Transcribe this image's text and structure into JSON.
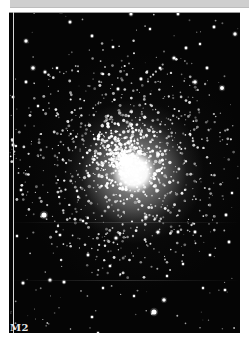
{
  "image": {
    "subject": "globular cluster",
    "label": "M2",
    "colors": {
      "background": "#050505",
      "stars": "#ffffff",
      "page": "#ffffff",
      "top_bar": "#cfcfcf"
    },
    "core": {
      "cx": 125,
      "cy": 160
    },
    "bright_stars": [
      [
        61,
        11,
        1.8
      ],
      [
        131,
        14,
        1.6
      ],
      [
        178,
        14,
        1.4
      ],
      [
        70,
        22,
        1.5
      ],
      [
        214,
        27,
        1.4
      ],
      [
        26,
        41,
        1.7
      ],
      [
        92,
        36,
        1.4
      ],
      [
        186,
        48,
        1.4
      ],
      [
        200,
        44,
        1.2
      ],
      [
        150,
        29,
        1.2
      ],
      [
        235,
        34,
        1.7
      ],
      [
        33,
        68,
        1.8
      ],
      [
        26,
        82,
        1.4
      ],
      [
        45,
        72,
        1.5
      ],
      [
        113,
        47,
        1.3
      ],
      [
        174,
        58,
        1.6
      ],
      [
        207,
        68,
        1.4
      ],
      [
        195,
        82,
        1.8
      ],
      [
        141,
        79,
        1.4
      ],
      [
        222,
        88,
        2.0
      ],
      [
        57,
        68,
        1.2
      ],
      [
        160,
        68,
        1.3
      ],
      [
        118,
        89,
        1.4
      ],
      [
        38,
        106,
        1.2
      ],
      [
        13,
        97,
        1.3
      ],
      [
        44,
        215,
        2.6
      ],
      [
        60,
        235,
        1.3
      ],
      [
        83,
        221,
        1.2
      ],
      [
        88,
        255,
        1.4
      ],
      [
        23,
        283,
        1.5
      ],
      [
        50,
        280,
        1.6
      ],
      [
        64,
        282,
        1.5
      ],
      [
        103,
        288,
        1.2
      ],
      [
        92,
        317,
        1.3
      ],
      [
        98,
        333,
        1.2
      ],
      [
        154,
        312,
        2.6
      ],
      [
        164,
        300,
        1.8
      ],
      [
        167,
        276,
        1.2
      ],
      [
        134,
        296,
        1.2
      ],
      [
        183,
        264,
        1.2
      ],
      [
        203,
        288,
        1.2
      ],
      [
        225,
        290,
        1.3
      ],
      [
        210,
        255,
        1.3
      ],
      [
        229,
        242,
        1.4
      ],
      [
        178,
        232,
        1.4
      ],
      [
        158,
        232,
        1.6
      ],
      [
        146,
        217,
        1.6
      ],
      [
        195,
        232,
        1.4
      ],
      [
        226,
        215,
        1.4
      ],
      [
        232,
        193,
        1.2
      ],
      [
        13,
        145,
        1.4
      ],
      [
        21,
        190,
        1.3
      ],
      [
        17,
        236,
        1.2
      ],
      [
        110,
        266,
        1.3
      ],
      [
        116,
        238,
        1.6
      ]
    ]
  }
}
